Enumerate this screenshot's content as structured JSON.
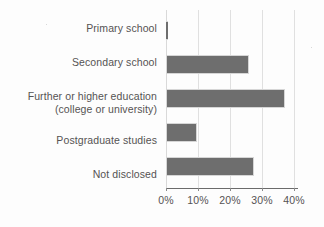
{
  "chart_data": {
    "type": "bar",
    "orientation": "horizontal",
    "title": "",
    "xlabel": "",
    "ylabel": "",
    "categories": [
      "Primary school",
      "Secondary school",
      "Further or higher education (college or university)",
      "Postgraduate studies",
      "Not disclosed"
    ],
    "values": [
      0.5,
      26.5,
      38,
      10,
      28
    ],
    "value_unit": "%",
    "xlim": [
      0,
      42
    ],
    "xticks": [
      0,
      10,
      20,
      30,
      40
    ],
    "xtick_labels": [
      "0%",
      "10%",
      "20%",
      "30%",
      "40%"
    ],
    "grid": "vertical",
    "legend": "none",
    "bar_color": "#6e6e6e",
    "bar_edge_color": "#d6d6d6",
    "gridline_color": "#e0e0e0",
    "axis_color": "#6b6b6b",
    "text_color": "#555353"
  },
  "categories": [
    {
      "line1": "Primary school",
      "line2": ""
    },
    {
      "line1": "Secondary school",
      "line2": ""
    },
    {
      "line1": "Further or higher education",
      "line2": "(college or university)"
    },
    {
      "line1": "Postgraduate studies",
      "line2": ""
    },
    {
      "line1": "Not disclosed",
      "line2": ""
    }
  ],
  "xticks": [
    {
      "label": "0%"
    },
    {
      "label": "10%"
    },
    {
      "label": "20%"
    },
    {
      "label": "30%"
    },
    {
      "label": "40%"
    }
  ]
}
